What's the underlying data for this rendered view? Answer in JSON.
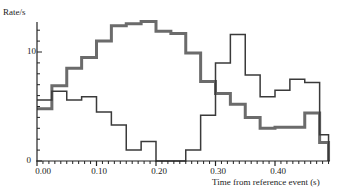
{
  "chart_data": {
    "type": "line",
    "style": "step-histogram",
    "title": "",
    "xlabel": "Time from reference event (s)",
    "ylabel": "Rate/s",
    "xlim": [
      0.0,
      0.49
    ],
    "ylim": [
      0,
      12.5
    ],
    "x_ticks": [
      "0.00",
      "0.10",
      "0.20",
      "0.30",
      "0.40"
    ],
    "x_tick_values": [
      0.0,
      0.1,
      0.2,
      0.3,
      0.4
    ],
    "y_ticks": [
      "0",
      "10"
    ],
    "y_tick_values": [
      0,
      10
    ],
    "grid": false,
    "legend": null,
    "bin_edges": [
      0.0,
      0.025,
      0.05,
      0.075,
      0.1,
      0.125,
      0.15,
      0.175,
      0.2,
      0.225,
      0.25,
      0.275,
      0.3,
      0.325,
      0.35,
      0.375,
      0.4,
      0.425,
      0.45,
      0.475,
      0.49
    ],
    "series": [
      {
        "name": "thick-gray",
        "color": "#6b6b6b",
        "line_width": 3,
        "values": [
          4.8,
          6.9,
          8.5,
          9.5,
          11.0,
          12.4,
          12.6,
          12.8,
          11.9,
          11.7,
          9.9,
          7.3,
          6.2,
          5.2,
          4.0,
          3.0,
          3.1,
          3.1,
          4.4,
          1.7
        ]
      },
      {
        "name": "thin-dark",
        "color": "#3a3a3a",
        "line_width": 1.5,
        "values": [
          5.6,
          6.4,
          5.6,
          5.9,
          4.5,
          3.3,
          1.0,
          1.8,
          0.0,
          0.0,
          1.0,
          4.2,
          9.0,
          11.6,
          7.9,
          5.9,
          6.5,
          7.5,
          7.2,
          2.4
        ]
      }
    ]
  }
}
